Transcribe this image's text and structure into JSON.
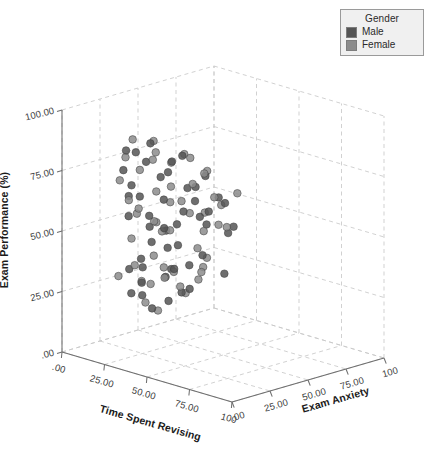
{
  "chart_data": {
    "type": "scatter",
    "title": "",
    "projection": "3d",
    "xlabel": "Time Spent Revising",
    "ylabel": "Exam Performance (%)",
    "zlabel": "Exam Anxiety",
    "xlim": [
      0,
      100
    ],
    "ylim": [
      0,
      100
    ],
    "zlim": [
      0,
      100
    ],
    "grid": true,
    "grid_style": "dashed",
    "x_ticks": [
      ".00",
      "25.00",
      "50.00",
      "75.00",
      "100"
    ],
    "x_tick_values": [
      0,
      25,
      50,
      75,
      100
    ],
    "y_ticks": [
      ".00",
      "25.00",
      "50.00",
      "75.00",
      "100.00"
    ],
    "y_tick_values": [
      0,
      25,
      50,
      75,
      100
    ],
    "z_ticks": [
      "100",
      "75.00",
      "50.00",
      "25.00",
      ".00"
    ],
    "z_tick_values": [
      100,
      75,
      50,
      25,
      0
    ],
    "legend": {
      "title": "Gender",
      "position": "top-right",
      "entries": [
        {
          "label": "Male",
          "color": "#555555"
        },
        {
          "label": "Female",
          "color": "#8c8c8c"
        }
      ]
    },
    "marker": {
      "shape": "circle",
      "size": 7.6,
      "edge_color": "#3f3f3f",
      "opacity": 0.85
    },
    "series": [
      {
        "name": "Male",
        "color": "#555555",
        "points": [
          [
            18,
            83,
            22
          ],
          [
            20,
            76,
            18
          ],
          [
            16,
            63,
            26
          ],
          [
            23,
            70,
            20
          ],
          [
            24,
            58,
            17
          ],
          [
            28,
            80,
            24
          ],
          [
            30,
            86,
            15
          ],
          [
            27,
            66,
            21
          ],
          [
            33,
            74,
            28
          ],
          [
            35,
            90,
            19
          ],
          [
            31,
            54,
            23
          ],
          [
            37,
            61,
            16
          ],
          [
            40,
            78,
            25
          ],
          [
            42,
            68,
            20
          ],
          [
            38,
            46,
            27
          ],
          [
            45,
            84,
            22
          ],
          [
            44,
            57,
            18
          ],
          [
            47,
            72,
            30
          ],
          [
            50,
            64,
            24
          ],
          [
            49,
            41,
            19
          ],
          [
            52,
            88,
            21
          ],
          [
            55,
            69,
            26
          ],
          [
            53,
            52,
            17
          ],
          [
            58,
            76,
            23
          ],
          [
            60,
            60,
            28
          ],
          [
            57,
            44,
            20
          ],
          [
            62,
            81,
            25
          ],
          [
            65,
            66,
            18
          ],
          [
            63,
            49,
            22
          ],
          [
            68,
            73,
            27
          ],
          [
            26,
            36,
            24
          ],
          [
            29,
            31,
            20
          ],
          [
            32,
            27,
            17
          ],
          [
            35,
            33,
            29
          ],
          [
            22,
            25,
            21
          ],
          [
            41,
            38,
            26
          ],
          [
            36,
            22,
            19
          ],
          [
            19,
            34,
            23
          ],
          [
            70,
            58,
            31
          ],
          [
            72,
            70,
            16
          ],
          [
            66,
            40,
            33
          ],
          [
            59,
            35,
            18
          ],
          [
            48,
            30,
            25
          ],
          [
            43,
            26,
            22
          ],
          [
            75,
            62,
            29
          ],
          [
            78,
            74,
            20
          ],
          [
            25,
            45,
            31
          ],
          [
            30,
            50,
            35
          ],
          [
            34,
            43,
            14
          ],
          [
            39,
            55,
            32
          ]
        ]
      },
      {
        "name": "Female",
        "color": "#8c8c8c",
        "points": [
          [
            15,
            79,
            25
          ],
          [
            17,
            71,
            19
          ],
          [
            21,
            88,
            23
          ],
          [
            25,
            65,
            16
          ],
          [
            19,
            56,
            28
          ],
          [
            27,
            77,
            21
          ],
          [
            31,
            84,
            27
          ],
          [
            29,
            62,
            18
          ],
          [
            34,
            69,
            24
          ],
          [
            36,
            91,
            20
          ],
          [
            32,
            51,
            30
          ],
          [
            39,
            59,
            17
          ],
          [
            41,
            82,
            26
          ],
          [
            44,
            67,
            22
          ],
          [
            37,
            44,
            19
          ],
          [
            46,
            86,
            29
          ],
          [
            43,
            55,
            23
          ],
          [
            48,
            75,
            18
          ],
          [
            51,
            63,
            27
          ],
          [
            47,
            39,
            21
          ],
          [
            54,
            87,
            24
          ],
          [
            56,
            71,
            16
          ],
          [
            52,
            48,
            31
          ],
          [
            59,
            78,
            20
          ],
          [
            61,
            58,
            25
          ],
          [
            58,
            42,
            28
          ],
          [
            64,
            83,
            22
          ],
          [
            67,
            68,
            19
          ],
          [
            62,
            47,
            26
          ],
          [
            69,
            74,
            23
          ],
          [
            24,
            37,
            21
          ],
          [
            28,
            29,
            27
          ],
          [
            33,
            24,
            18
          ],
          [
            38,
            34,
            25
          ],
          [
            20,
            28,
            30
          ],
          [
            42,
            40,
            20
          ],
          [
            35,
            20,
            24
          ],
          [
            18,
            32,
            17
          ],
          [
            71,
            61,
            29
          ],
          [
            74,
            72,
            22
          ],
          [
            65,
            43,
            19
          ],
          [
            57,
            37,
            26
          ],
          [
            49,
            33,
            23
          ],
          [
            45,
            28,
            31
          ],
          [
            76,
            65,
            18
          ],
          [
            79,
            77,
            27
          ],
          [
            23,
            48,
            20
          ],
          [
            26,
            53,
            33
          ],
          [
            40,
            85,
            15
          ],
          [
            55,
            80,
            34
          ]
        ]
      }
    ]
  },
  "legend": {
    "title": "Gender",
    "male": "Male",
    "female": "Female"
  },
  "axes": {
    "y_title": "Exam Performance (%)",
    "x_title": "Time Spent Revising",
    "z_title": "Exam Anxiety",
    "y_ticks": [
      ".00",
      "25.00",
      "50.00",
      "75.00",
      "100.00"
    ],
    "x_ticks": [
      ".00",
      "25.00",
      "50.00",
      "75.00",
      "100"
    ],
    "z_ticks": [
      "100",
      "75.00",
      "50.00",
      "25.00",
      ".00"
    ]
  },
  "colors": {
    "male": "#555555",
    "female": "#8c8c8c",
    "grid": "#c9c9c9",
    "axis": "#6e6e6e",
    "text": "#2a2a2a"
  }
}
